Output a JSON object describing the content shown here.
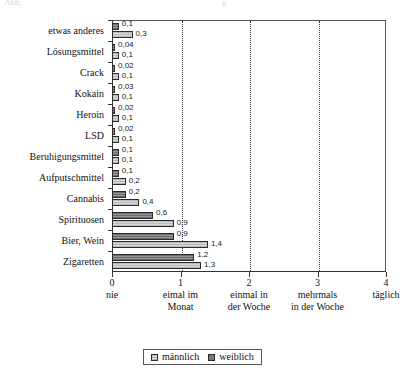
{
  "header_remnant": {
    "left": "Abb.",
    "right": "g"
  },
  "chart_data": {
    "type": "bar",
    "orientation": "horizontal",
    "title": "",
    "xlabel": "",
    "ylabel": "",
    "xlim": [
      0,
      4
    ],
    "grid": "vertical-dotted",
    "legend_position": "bottom-center",
    "categories": [
      "etwas anderes",
      "Lösungsmittel",
      "Crack",
      "Kokain",
      "Heroin",
      "LSD",
      "Beruhigungsmittel",
      "Aufputschmittel",
      "Cannabis",
      "Spirituosen",
      "Bier, Wein",
      "Zigaretten"
    ],
    "series": [
      {
        "name": "männlich",
        "values": [
          0.1,
          0.04,
          0.02,
          0.03,
          0.02,
          0.02,
          0.1,
          0.1,
          0.2,
          0.6,
          0.9,
          1.2
        ],
        "labels": [
          "0,1",
          "0,04",
          "0,02",
          "0,03",
          "0,02",
          "0,02",
          "0,1",
          "0,1",
          "0,2",
          "0,6",
          "0,9",
          "1,2"
        ]
      },
      {
        "name": "weiblich",
        "values": [
          0.3,
          0.1,
          0.1,
          0.1,
          0.1,
          0.1,
          0.1,
          0.2,
          0.4,
          0.9,
          1.4,
          1.3
        ],
        "labels": [
          "0,3",
          "0,1",
          "0,1",
          "0,1",
          "0,1",
          "0,1",
          "0,1",
          "0,2",
          "0,4",
          "0,9",
          "1,4",
          "1,3"
        ]
      }
    ],
    "xticks": [
      {
        "value": 0,
        "num": "0",
        "line1": "nie",
        "line2": ""
      },
      {
        "value": 1,
        "num": "1",
        "line1": "eimal im",
        "line2": "Monat"
      },
      {
        "value": 2,
        "num": "2",
        "line1": "einmal in",
        "line2": "der Woche"
      },
      {
        "value": 3,
        "num": "3",
        "line1": "mehrmals",
        "line2": "in der Woche"
      },
      {
        "value": 4,
        "num": "4",
        "line1": "täglich",
        "line2": ""
      }
    ],
    "gridlines": [
      1,
      2,
      3
    ]
  },
  "legend": {
    "items": [
      {
        "label": "männlich",
        "swatch": "male-swatch"
      },
      {
        "label": "weiblich",
        "swatch": "female-swatch"
      }
    ]
  }
}
